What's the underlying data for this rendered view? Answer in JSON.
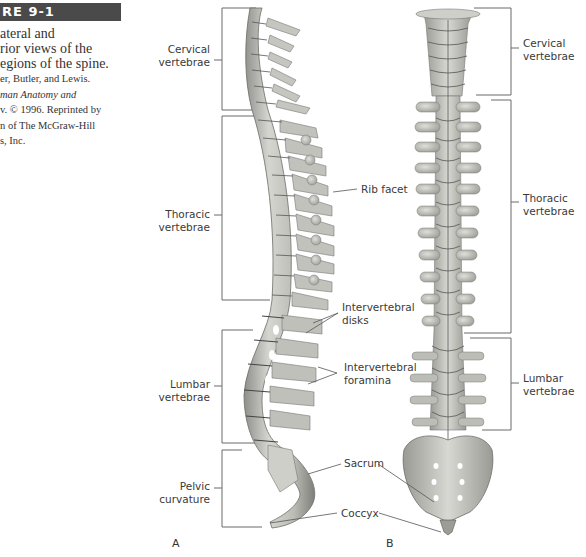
{
  "figure": {
    "header": "RE 9-1",
    "caption_lines": [
      "ateral and",
      "rior views of the",
      "egions of the spine."
    ],
    "credit_lines": [
      "er, Butler, and Lewis.",
      "man Anatomy and",
      "v. © 1996. Reprinted by",
      "n of The McGraw-Hill",
      "s, Inc."
    ],
    "credit_italic_line_index": 1
  },
  "panel_a": {
    "letter": "A",
    "regions": [
      {
        "name": "cervical",
        "line1": "Cervical",
        "line2": "vertebrae"
      },
      {
        "name": "thoracic",
        "line1": "Thoracic",
        "line2": "vertebrae"
      },
      {
        "name": "lumbar",
        "line1": "Lumbar",
        "line2": "vertebrae"
      },
      {
        "name": "pelvic",
        "line1": "Pelvic",
        "line2": "curvature"
      }
    ]
  },
  "panel_b": {
    "letter": "B",
    "regions": [
      {
        "name": "cervical",
        "line1": "Cervical",
        "line2": "vertebrae"
      },
      {
        "name": "thoracic",
        "line1": "Thoracic",
        "line2": "vertebrae"
      },
      {
        "name": "lumbar",
        "line1": "Lumbar",
        "line2": "vertebrae"
      }
    ]
  },
  "center_labels": {
    "rib_facet": "Rib facet",
    "intervertebral_disks": [
      "Intervertebral",
      "disks"
    ],
    "intervertebral_foramina": [
      "Intervertebral",
      "foramina"
    ],
    "sacrum": "Sacrum",
    "coccyx": "Coccyx"
  },
  "colors": {
    "bone_light": "#d9d9d4",
    "bone_mid": "#b4b4ae",
    "bone_dark": "#7c7c78",
    "bracket": "#6a6a6a",
    "header_bg": "#4a4a4a"
  }
}
